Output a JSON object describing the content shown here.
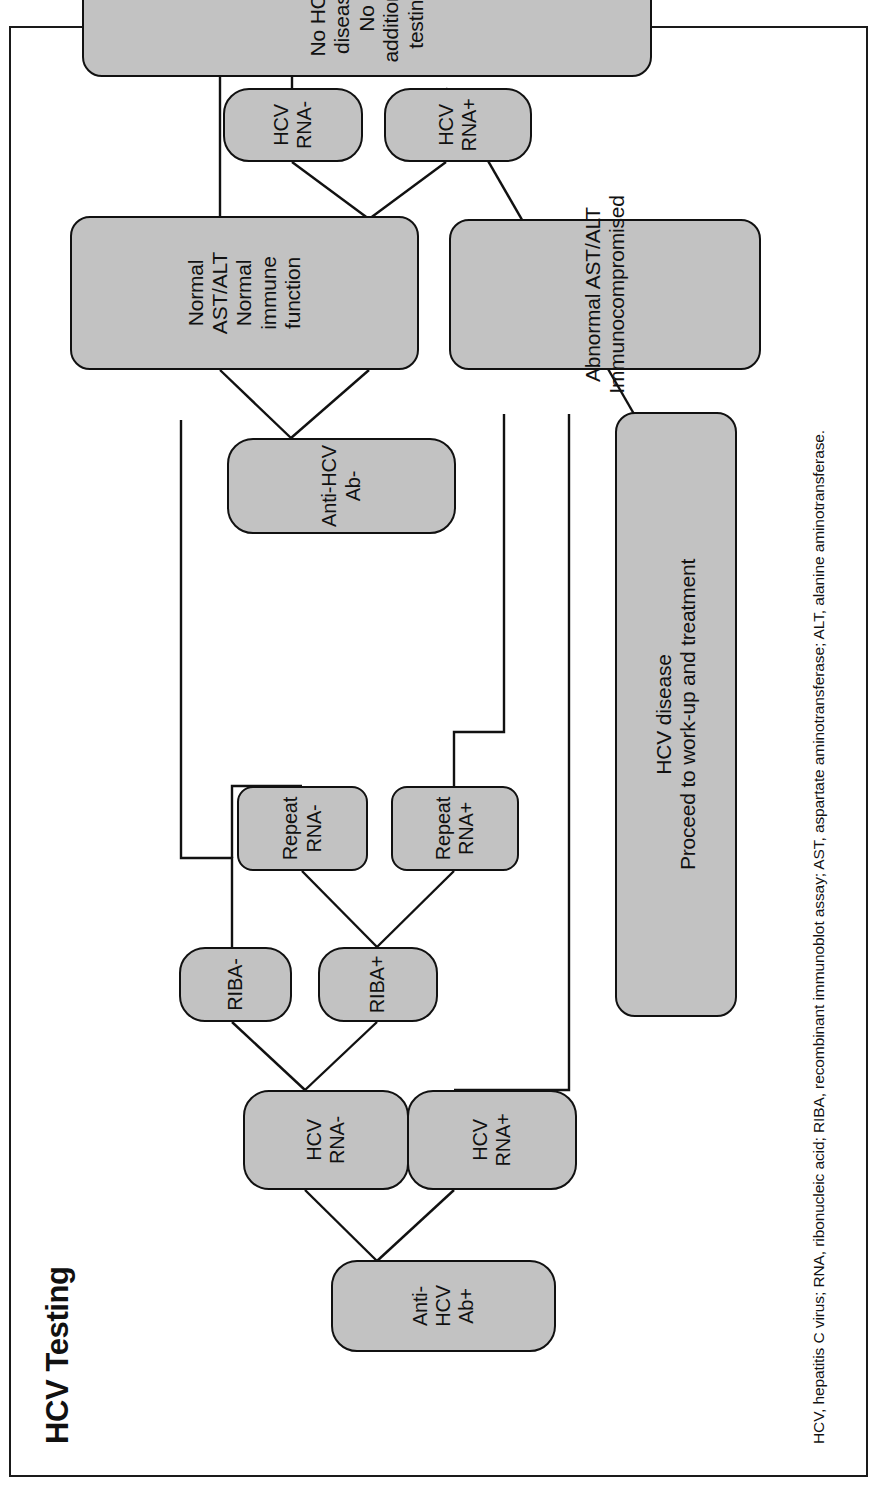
{
  "figure": {
    "title": "HCV Testing",
    "footnote": "HCV, hepatitis C virus; RNA, ribonucleic acid; RIBA, recombinant immunoblot assay; AST, aspartate aminotransferase; ALT, alanine aminotransferase.",
    "orientation": "rotated-90-counterclockwise",
    "colors": {
      "node_fill": "#c2c2c2",
      "node_stroke": "#111111",
      "edge_stroke": "#111111",
      "text": "#111111",
      "background": "#ffffff",
      "frame": "#1a1a1a"
    }
  },
  "nodes": {
    "anti_hcv_ab_pos": "Anti-HCV Ab+",
    "hcv_rna_neg_a": "HCV RNA-",
    "hcv_rna_pos_a": "HCV RNA+",
    "riba_neg": "RIBA-",
    "riba_pos": "RIBA+",
    "repeat_rna_neg": "Repeat\nRNA-",
    "repeat_rna_pos": "Repeat\nRNA+",
    "hcv_disease": "HCV disease\nProceed to work-up and treatment",
    "anti_hcv_ab_neg": "Anti-HCV Ab-",
    "normal_ast_alt": "Normal AST/ALT\nNormal immune function",
    "abnormal_ast_alt": "Abnormal AST/ALT\nImmunocompromised",
    "hcv_rna_neg_b": "HCV RNA-",
    "hcv_rna_pos_b": "HCV RNA+",
    "no_hcv_disease": "No HCV disease\nNo additional testing"
  },
  "chart_data": {
    "type": "diagram",
    "diagram_kind": "clinical decision flowchart",
    "title": "HCV Testing",
    "branches": [
      {
        "root": "Anti-HCV Ab+",
        "edges": [
          [
            "Anti-HCV Ab+",
            "HCV RNA-"
          ],
          [
            "Anti-HCV Ab+",
            "HCV RNA+"
          ],
          [
            "HCV RNA-",
            "RIBA-"
          ],
          [
            "HCV RNA-",
            "RIBA+"
          ],
          [
            "RIBA-",
            "No HCV disease / No additional testing"
          ],
          [
            "RIBA+",
            "Repeat RNA-"
          ],
          [
            "RIBA+",
            "Repeat RNA+"
          ],
          [
            "Repeat RNA-",
            "No HCV disease / No additional testing"
          ],
          [
            "Repeat RNA+",
            "HCV disease / Proceed to work-up and treatment"
          ],
          [
            "HCV RNA+",
            "HCV disease / Proceed to work-up and treatment"
          ]
        ]
      },
      {
        "root": "Anti-HCV Ab-",
        "edges": [
          [
            "Anti-HCV Ab-",
            "Normal AST/ALT Normal immune function"
          ],
          [
            "Anti-HCV Ab-",
            "Abnormal AST/ALT Immunocompromised"
          ],
          [
            "Normal AST/ALT Normal immune function",
            "No HCV disease / No additional testing"
          ],
          [
            "Abnormal AST/ALT Immunocompromised",
            "HCV RNA-"
          ],
          [
            "Abnormal AST/ALT Immunocompromised",
            "HCV RNA+"
          ],
          [
            "HCV RNA-",
            "No HCV disease / No additional testing"
          ],
          [
            "HCV RNA+",
            "HCV disease / Proceed to work-up and treatment"
          ]
        ]
      }
    ],
    "terminal_outcomes": [
      "No HCV disease / No additional testing",
      "HCV disease / Proceed to work-up and treatment"
    ]
  }
}
